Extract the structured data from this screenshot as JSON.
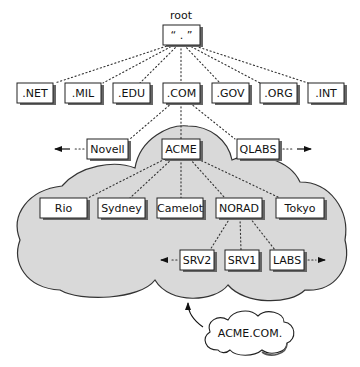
{
  "diagram": {
    "type": "dns-hierarchy",
    "root": {
      "caption": "root",
      "label": "“ . ”"
    },
    "tlds": [
      {
        "id": "net",
        "label": ".NET"
      },
      {
        "id": "mil",
        "label": ".MIL"
      },
      {
        "id": "edu",
        "label": ".EDU"
      },
      {
        "id": "com",
        "label": ".COM"
      },
      {
        "id": "gov",
        "label": ".GOV"
      },
      {
        "id": "org",
        "label": ".ORG"
      },
      {
        "id": "int",
        "label": ".INT"
      }
    ],
    "com_children": [
      {
        "id": "novell",
        "label": "Novell"
      },
      {
        "id": "acme",
        "label": "ACME"
      },
      {
        "id": "qlabs",
        "label": "QLABS"
      }
    ],
    "acme_children": [
      {
        "id": "rio",
        "label": "Rio"
      },
      {
        "id": "sydney",
        "label": "Sydney"
      },
      {
        "id": "camelot",
        "label": "Camelot"
      },
      {
        "id": "norad",
        "label": "NORAD"
      },
      {
        "id": "tokyo",
        "label": "Tokyo"
      }
    ],
    "norad_children": [
      {
        "id": "srv2",
        "label": "SRV2"
      },
      {
        "id": "srv1",
        "label": "SRV1"
      },
      {
        "id": "labs",
        "label": "LABS"
      }
    ],
    "zone_callout": {
      "label": "ACME.COM."
    },
    "colors": {
      "zone_fill": "#d9d9d9",
      "zone_stroke": "#333333",
      "box_fill": "#ffffff",
      "box_stroke": "#222222",
      "connector": "#333333"
    }
  }
}
